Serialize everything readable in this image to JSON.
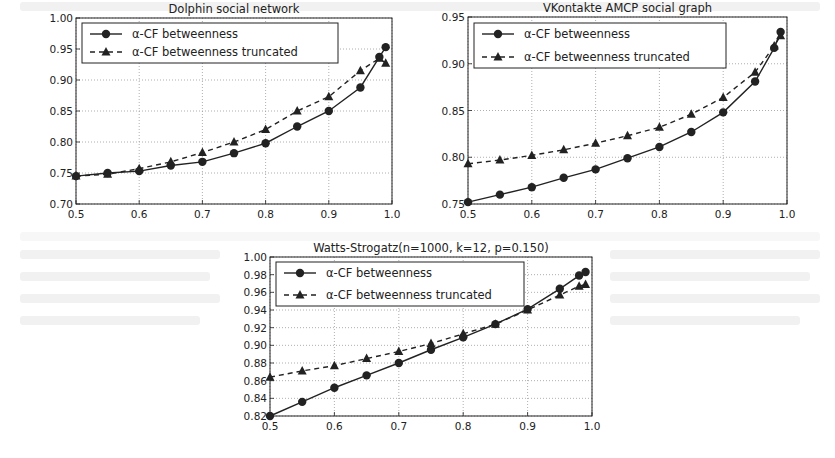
{
  "page": {
    "background": "#ffffff",
    "note": "Three line charts comparing alpha-CF betweenness vs truncated variant"
  },
  "chart_data": [
    {
      "id": "dolphin",
      "type": "line",
      "title": "Dolphin social network",
      "xlabel": "",
      "ylabel": "",
      "x": [
        0.5,
        0.55,
        0.6,
        0.65,
        0.7,
        0.75,
        0.8,
        0.85,
        0.9,
        0.95,
        0.98,
        0.99
      ],
      "xlim": [
        0.5,
        1.0
      ],
      "ylim": [
        0.7,
        1.0
      ],
      "xticks": [
        "0.5",
        "0.6",
        "0.7",
        "0.8",
        "0.9",
        "1.0"
      ],
      "yticks": [
        "0.70",
        "0.75",
        "0.80",
        "0.85",
        "0.90",
        "0.95",
        "1.00"
      ],
      "grid": true,
      "legend_position": "upper left",
      "series": [
        {
          "name": "α-CF betweenness",
          "style": "solid",
          "marker": "circle",
          "values": [
            0.745,
            0.75,
            0.753,
            0.762,
            0.768,
            0.782,
            0.798,
            0.825,
            0.85,
            0.888,
            0.937,
            0.953
          ]
        },
        {
          "name": "α-CF betweenness truncated",
          "style": "dashed",
          "marker": "triangle",
          "values": [
            0.745,
            0.748,
            0.757,
            0.768,
            0.783,
            0.8,
            0.82,
            0.85,
            0.873,
            0.915,
            0.935,
            0.927
          ]
        }
      ]
    },
    {
      "id": "vkontakte",
      "type": "line",
      "title": "VKontakte AMCP social graph",
      "xlabel": "",
      "ylabel": "",
      "x": [
        0.5,
        0.55,
        0.6,
        0.65,
        0.7,
        0.75,
        0.8,
        0.85,
        0.9,
        0.95,
        0.98,
        0.99
      ],
      "xlim": [
        0.5,
        1.0
      ],
      "ylim": [
        0.75,
        0.95
      ],
      "xticks": [
        "0.5",
        "0.6",
        "0.7",
        "0.8",
        "0.9",
        "1.0"
      ],
      "yticks": [
        "0.75",
        "0.80",
        "0.85",
        "0.90",
        "0.95"
      ],
      "grid": true,
      "legend_position": "upper left",
      "series": [
        {
          "name": "α-CF betweenness",
          "style": "solid",
          "marker": "circle",
          "values": [
            0.752,
            0.76,
            0.768,
            0.778,
            0.787,
            0.799,
            0.811,
            0.827,
            0.848,
            0.881,
            0.917,
            0.934
          ]
        },
        {
          "name": "α-CF betweenness truncated",
          "style": "dashed",
          "marker": "triangle",
          "values": [
            0.793,
            0.797,
            0.802,
            0.808,
            0.815,
            0.823,
            0.832,
            0.846,
            0.864,
            0.891,
            0.919,
            0.93
          ]
        }
      ]
    },
    {
      "id": "watts-strogatz",
      "type": "line",
      "title": "Watts-Strogatz(n=1000, k=12, p=0.150)",
      "xlabel": "",
      "ylabel": "",
      "x": [
        0.5,
        0.55,
        0.6,
        0.65,
        0.7,
        0.75,
        0.8,
        0.85,
        0.9,
        0.95,
        0.98,
        0.99
      ],
      "xlim": [
        0.5,
        1.0
      ],
      "ylim": [
        0.82,
        1.0
      ],
      "xticks": [
        "0.5",
        "0.6",
        "0.7",
        "0.8",
        "0.9",
        "1.0"
      ],
      "yticks": [
        "0.82",
        "0.84",
        "0.86",
        "0.88",
        "0.90",
        "0.92",
        "0.94",
        "0.96",
        "0.98",
        "1.00"
      ],
      "grid": true,
      "legend_position": "upper left",
      "series": [
        {
          "name": "α-CF betweenness",
          "style": "solid",
          "marker": "circle",
          "values": [
            0.82,
            0.836,
            0.852,
            0.866,
            0.88,
            0.895,
            0.909,
            0.924,
            0.941,
            0.964,
            0.979,
            0.983
          ]
        },
        {
          "name": "α-CF betweenness truncated",
          "style": "dashed",
          "marker": "triangle",
          "values": [
            0.864,
            0.871,
            0.877,
            0.885,
            0.893,
            0.902,
            0.913,
            0.924,
            0.94,
            0.957,
            0.967,
            0.969
          ]
        }
      ]
    }
  ],
  "layout": {
    "charts": [
      {
        "plot": {
          "left": 76,
          "top": 18,
          "right": 392,
          "bottom": 204
        },
        "legend": {
          "x": 82,
          "y": 23,
          "w": 256,
          "h": 40
        }
      },
      {
        "plot": {
          "left": 468,
          "top": 17,
          "right": 787,
          "bottom": 204
        },
        "legend": {
          "x": 474,
          "y": 23,
          "w": 252,
          "h": 45
        }
      },
      {
        "plot": {
          "left": 270,
          "top": 257,
          "right": 592,
          "bottom": 416
        },
        "legend": {
          "x": 276,
          "y": 262,
          "w": 248,
          "h": 44
        }
      }
    ]
  },
  "colors": {
    "line": "#222222",
    "grid": "#9a9a9a",
    "axis": "#222222"
  }
}
